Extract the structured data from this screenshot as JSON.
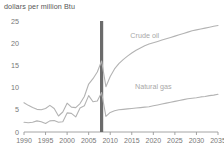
{
  "chart_data": {
    "type": "line",
    "title": "",
    "ylabel": "dollars per million Btu",
    "xlabel": "",
    "ylim": [
      0,
      25
    ],
    "xlim": [
      1990,
      2035
    ],
    "yticks": [
      0,
      5,
      10,
      15,
      20,
      25
    ],
    "xticks": [
      1990,
      1995,
      2000,
      2005,
      2010,
      2015,
      2020,
      2025,
      2030,
      2035
    ],
    "grid": false,
    "legend_position": "inline-annotation",
    "annotations": [
      {
        "text": "Crude oil",
        "x": 2018,
        "y": 21.2
      },
      {
        "text": "Natural gas",
        "x": 2020,
        "y": 9.6
      }
    ],
    "projection_divider": {
      "x": 2008,
      "label": "",
      "color": "#6b6b6b"
    },
    "series": [
      {
        "name": "Crude oil",
        "color": "#b3b3b3",
        "x": [
          1990,
          1991,
          1992,
          1993,
          1994,
          1995,
          1996,
          1997,
          1998,
          1999,
          2000,
          2001,
          2002,
          2003,
          2004,
          2005,
          2006,
          2007,
          2008,
          2009,
          2010,
          2011,
          2012,
          2013,
          2014,
          2015,
          2016,
          2017,
          2018,
          2019,
          2020,
          2021,
          2022,
          2023,
          2024,
          2025,
          2026,
          2027,
          2028,
          2029,
          2030,
          2031,
          2032,
          2033,
          2034,
          2035
        ],
        "values": [
          6.6,
          6.0,
          5.5,
          5.1,
          5.0,
          5.3,
          6.0,
          5.3,
          3.6,
          4.5,
          6.5,
          5.6,
          5.5,
          6.4,
          8.0,
          10.8,
          12.0,
          13.5,
          16.0,
          10.2,
          12.5,
          14.2,
          15.4,
          16.3,
          17.1,
          17.8,
          18.4,
          18.9,
          19.4,
          19.8,
          20.1,
          20.4,
          20.7,
          21.0,
          21.3,
          21.6,
          21.9,
          22.2,
          22.5,
          22.8,
          23.0,
          23.2,
          23.4,
          23.6,
          23.8,
          24.0
        ]
      },
      {
        "name": "Natural gas",
        "color": "#b3b3b3",
        "x": [
          1990,
          1991,
          1992,
          1993,
          1994,
          1995,
          1996,
          1997,
          1998,
          1999,
          2000,
          2001,
          2002,
          2003,
          2004,
          2005,
          2006,
          2007,
          2008,
          2009,
          2010,
          2011,
          2012,
          2013,
          2014,
          2015,
          2016,
          2017,
          2018,
          2019,
          2020,
          2021,
          2022,
          2023,
          2024,
          2025,
          2026,
          2027,
          2028,
          2029,
          2030,
          2031,
          2032,
          2033,
          2034,
          2035
        ],
        "values": [
          2.2,
          2.1,
          2.2,
          2.5,
          2.3,
          1.9,
          2.5,
          2.6,
          2.2,
          2.3,
          4.3,
          4.2,
          3.4,
          5.4,
          5.9,
          8.2,
          6.8,
          7.0,
          8.9,
          3.5,
          4.4,
          4.8,
          5.0,
          5.1,
          5.2,
          5.3,
          5.4,
          5.5,
          5.6,
          5.7,
          5.9,
          6.1,
          6.3,
          6.5,
          6.7,
          6.9,
          7.1,
          7.3,
          7.5,
          7.6,
          7.7,
          7.9,
          8.0,
          8.2,
          8.3,
          8.5
        ]
      }
    ]
  }
}
